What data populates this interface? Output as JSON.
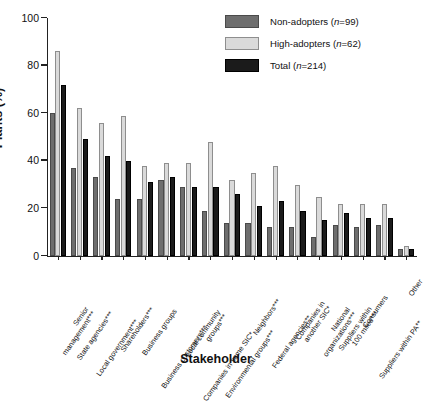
{
  "chart_data": {
    "type": "bar",
    "title": "",
    "xlabel": "Stakeholder",
    "ylabel": "Plants (%)",
    "ylim": [
      0,
      100
    ],
    "yticks": [
      0,
      20,
      40,
      60,
      80,
      100
    ],
    "grid": false,
    "legend_position": "top-right",
    "categories": [
      "Senior management***",
      "State agencies***",
      "Local government***",
      "Shareholders***",
      "Business groups",
      "Business customers***",
      "Local community groups***",
      "Companies in same SIC*",
      "Environmental groups***",
      "Neighbors***",
      "Federal agencies**",
      "Companies in another SIC*",
      "National organizations***",
      "Suppliers within 100 miles***",
      "Consumers",
      "Suppliers within PA**",
      "Other"
    ],
    "series": [
      {
        "name": "Non-adopters (n=99)",
        "color": "#6e6e6e",
        "values": [
          60,
          37,
          33,
          24,
          24,
          32,
          29,
          19,
          14,
          14,
          12,
          12,
          8,
          13,
          12,
          13,
          3
        ]
      },
      {
        "name": "High-adopters (n=62)",
        "color": "#dadada",
        "values": [
          86,
          62,
          56,
          59,
          38,
          39,
          39,
          48,
          32,
          35,
          38,
          30,
          25,
          22,
          22,
          22,
          4
        ]
      },
      {
        "name": "Total (n=214)",
        "color": "#1b1b1b",
        "values": [
          72,
          49,
          42,
          40,
          31,
          33,
          29,
          29,
          26,
          21,
          23,
          19,
          15,
          18,
          16,
          16,
          3
        ]
      }
    ]
  },
  "legend": {
    "items": [
      {
        "label_main": "Non-adopters (",
        "label_var": "n",
        "label_tail": "=99)"
      },
      {
        "label_main": "High-adopters (",
        "label_var": "n",
        "label_tail": "=62)"
      },
      {
        "label_main": "Total (",
        "label_var": "n",
        "label_tail": "=214)"
      }
    ]
  },
  "axes": {
    "y_title": "Plants (%)",
    "x_title": "Stakeholder",
    "y_tick_labels": [
      "0",
      "20",
      "40",
      "60",
      "80",
      "100"
    ]
  }
}
